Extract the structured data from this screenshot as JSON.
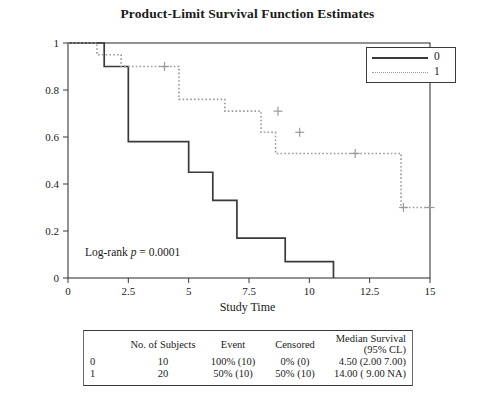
{
  "chart_data": {
    "type": "line",
    "title": "Product-Limit Survival Function Estimates",
    "xlabel": "Study Time",
    "ylabel": "Survival Probability",
    "xlim": [
      0,
      15
    ],
    "ylim": [
      0,
      1
    ],
    "xticks": [
      "0",
      "2.5",
      "5",
      "7.5",
      "10",
      "12.5",
      "15"
    ],
    "xtick_values": [
      0,
      2.5,
      5,
      7.5,
      10,
      12.5,
      15
    ],
    "yticks": [
      "0",
      "0.2",
      "0.4",
      "0.6",
      "0.8",
      "1"
    ],
    "ytick_values": [
      0,
      0.2,
      0.4,
      0.6,
      0.8,
      1
    ],
    "grid": false,
    "legend_position": "top-right",
    "annotation": "Log-rank p = 0.0001",
    "annotation_prefix": "Log-rank ",
    "annotation_italic": "p",
    "annotation_suffix": " = 0.0001",
    "series": [
      {
        "name": "0",
        "style": "solid",
        "color": "#3a3a3a",
        "steps": [
          [
            0,
            1.0
          ],
          [
            1.5,
            1.0
          ],
          [
            1.5,
            0.9
          ],
          [
            2.5,
            0.9
          ],
          [
            2.5,
            0.58
          ],
          [
            5.0,
            0.58
          ],
          [
            5.0,
            0.45
          ],
          [
            6.0,
            0.45
          ],
          [
            6.0,
            0.33
          ],
          [
            7.0,
            0.33
          ],
          [
            7.0,
            0.17
          ],
          [
            9.0,
            0.17
          ],
          [
            9.0,
            0.07
          ],
          [
            11.0,
            0.07
          ],
          [
            11.0,
            0.0
          ]
        ],
        "censor_marks": []
      },
      {
        "name": "1",
        "style": "dotted",
        "color": "#9a9a9a",
        "steps": [
          [
            0,
            1.0
          ],
          [
            1.2,
            1.0
          ],
          [
            1.2,
            0.95
          ],
          [
            2.2,
            0.95
          ],
          [
            2.2,
            0.9
          ],
          [
            4.6,
            0.9
          ],
          [
            4.6,
            0.76
          ],
          [
            6.5,
            0.76
          ],
          [
            6.5,
            0.71
          ],
          [
            8.0,
            0.71
          ],
          [
            8.0,
            0.62
          ],
          [
            8.6,
            0.62
          ],
          [
            8.6,
            0.53
          ],
          [
            13.8,
            0.53
          ],
          [
            13.8,
            0.3
          ],
          [
            15.0,
            0.3
          ]
        ],
        "censor_marks": [
          [
            4.0,
            0.9
          ],
          [
            8.7,
            0.71
          ],
          [
            9.6,
            0.62
          ],
          [
            11.9,
            0.53
          ],
          [
            13.9,
            0.3
          ],
          [
            15.0,
            0.3
          ]
        ]
      }
    ]
  },
  "legend": {
    "entries": [
      {
        "label": "0",
        "style": "solid"
      },
      {
        "label": "1",
        "style": "dotted"
      }
    ]
  },
  "table": {
    "headers": [
      "",
      "No. of Subjects",
      "Event",
      "Censored",
      "Median Survival (95% CL)"
    ],
    "rows": [
      {
        "group": "0",
        "subjects": "10",
        "event": "100% (10)",
        "censored": "0% (0)",
        "median": "4.50 (2.00  7.00)"
      },
      {
        "group": "1",
        "subjects": "20",
        "event": "50% (10)",
        "censored": "50% (10)",
        "median": "14.00 ( 9.00  NA)"
      }
    ]
  }
}
